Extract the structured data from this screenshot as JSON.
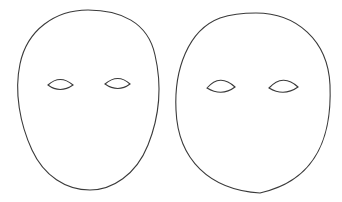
{
  "image": {
    "width": 342,
    "height": 202,
    "background": "#ffffff",
    "stroke_color": "#3a3a3a",
    "description": "Two blank mask/face outline drawings side by side"
  },
  "figures": [
    {
      "name": "narrow-oval-face",
      "shape": "egg-shaped oval, wider at top",
      "eyes": 2
    },
    {
      "name": "round-face",
      "shape": "rounder oval",
      "eyes": 2
    }
  ]
}
